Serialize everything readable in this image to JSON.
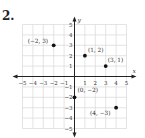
{
  "problem": {
    "number": "2."
  },
  "chart_data": {
    "type": "scatter",
    "title": "",
    "xlabel": "x",
    "ylabel": "y",
    "xlim": [
      -5,
      5
    ],
    "ylim": [
      -5,
      5
    ],
    "grid": true,
    "x_ticks": [
      "-5",
      "-4",
      "-3",
      "-2",
      "-1",
      "1",
      "2",
      "3",
      "4",
      "5"
    ],
    "y_ticks": [
      "5",
      "4",
      "3",
      "2",
      "1",
      "-1",
      "-2",
      "-3",
      "-4",
      "-5"
    ],
    "points": [
      {
        "x": -2,
        "y": 3,
        "label": "(−2, 3)"
      },
      {
        "x": 1,
        "y": 2,
        "label": "(1, 2)"
      },
      {
        "x": 3,
        "y": 1,
        "label": "(3, 1)"
      },
      {
        "x": 0,
        "y": -2,
        "label": "(0, −2)"
      },
      {
        "x": 4,
        "y": -3,
        "label": "(4, −3)"
      }
    ],
    "colors": {
      "grid": "#d8d8d8",
      "axis": "#222222",
      "point": "#111111"
    }
  }
}
